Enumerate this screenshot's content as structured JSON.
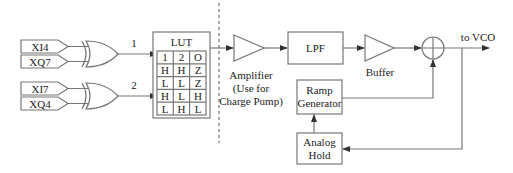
{
  "inputs": [
    {
      "label": "XI4"
    },
    {
      "label": "XQ7"
    },
    {
      "label": "XI7"
    },
    {
      "label": "XQ4"
    }
  ],
  "gate_outputs": [
    {
      "label": "1"
    },
    {
      "label": "2"
    }
  ],
  "lut": {
    "title": "LUT",
    "header": [
      "1",
      "2",
      "O"
    ],
    "rows": [
      [
        "H",
        "H",
        "Z"
      ],
      [
        "L",
        "L",
        "Z"
      ],
      [
        "H",
        "L",
        "H"
      ],
      [
        "L",
        "H",
        "L"
      ]
    ]
  },
  "blocks": {
    "amplifier": {
      "line1": "Amplifier",
      "line2": "(Use for",
      "line3": "Charge Pump)"
    },
    "lpf": {
      "label": "LPF"
    },
    "buffer": {
      "label": "Buffer"
    },
    "ramp": {
      "line1": "Ramp",
      "line2": "Generator"
    },
    "hold": {
      "line1": "Analog",
      "line2": "Hold"
    },
    "output": {
      "label": "to VCO"
    }
  }
}
